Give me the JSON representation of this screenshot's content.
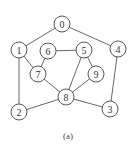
{
  "diagram": {
    "type": "undirected-graph",
    "caption": "(a)",
    "node_radius": 8,
    "nodes": [
      {
        "id": "0",
        "label": "0",
        "x": 62,
        "y": 24
      },
      {
        "id": "1",
        "label": "1",
        "x": 19,
        "y": 50
      },
      {
        "id": "2",
        "label": "2",
        "x": 19,
        "y": 112
      },
      {
        "id": "3",
        "label": "3",
        "x": 110,
        "y": 109
      },
      {
        "id": "4",
        "label": "4",
        "x": 118,
        "y": 49
      },
      {
        "id": "5",
        "label": "5",
        "x": 84,
        "y": 50
      },
      {
        "id": "6",
        "label": "6",
        "x": 48,
        "y": 51
      },
      {
        "id": "7",
        "label": "7",
        "x": 38,
        "y": 74
      },
      {
        "id": "8",
        "label": "8",
        "x": 66,
        "y": 97
      },
      {
        "id": "9",
        "label": "9",
        "x": 96,
        "y": 74
      }
    ],
    "edges": [
      [
        "0",
        "1"
      ],
      [
        "0",
        "4"
      ],
      [
        "1",
        "7"
      ],
      [
        "1",
        "2"
      ],
      [
        "6",
        "7"
      ],
      [
        "6",
        "5"
      ],
      [
        "5",
        "8"
      ],
      [
        "5",
        "9"
      ],
      [
        "9",
        "8"
      ],
      [
        "7",
        "8"
      ],
      [
        "8",
        "2"
      ],
      [
        "8",
        "3"
      ],
      [
        "3",
        "4"
      ]
    ],
    "caption_pos": {
      "x": 68,
      "y": 136
    }
  }
}
